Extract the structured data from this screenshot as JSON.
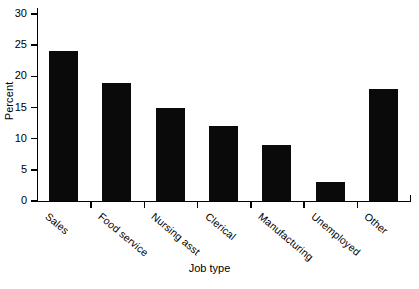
{
  "chart_data": {
    "type": "bar",
    "title": "",
    "xlabel": "Job type",
    "ylabel": "Percent",
    "categories": [
      "Sales",
      "Food service",
      "Nursing asst",
      "Clerical",
      "Manufacturing",
      "Unemployed",
      "Other"
    ],
    "values": [
      24,
      19,
      15,
      12,
      9,
      3,
      18
    ],
    "ylim": [
      0,
      30
    ],
    "yticks": [
      0,
      5,
      10,
      15,
      20,
      25,
      30
    ],
    "ytick_labels": [
      "0",
      "5",
      "10",
      "15",
      "20",
      "25",
      "30"
    ],
    "grid": false,
    "legend": null,
    "bar_color": "#0a0a0a",
    "axis_color": "#000000",
    "background_color": "#ffffff"
  }
}
